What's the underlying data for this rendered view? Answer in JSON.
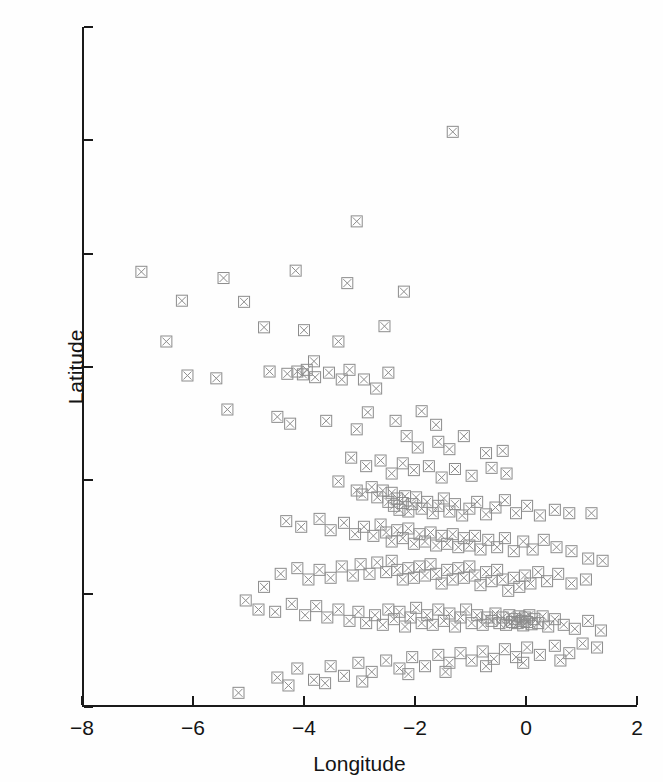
{
  "chart_data": {
    "type": "scatter",
    "title": "",
    "xlabel": "Longitude",
    "ylabel": "Latitude",
    "xlim": [
      -8,
      2
    ],
    "ylim": [
      50,
      62
    ],
    "xticks": [
      -8,
      -6,
      -4,
      -2,
      0,
      2
    ],
    "yticks": [
      50,
      52,
      54,
      56,
      58,
      60,
      62
    ],
    "xtick_labels": [
      "−8",
      "−6",
      "−4",
      "−2",
      "0",
      "2"
    ],
    "ytick_labels": [
      "50",
      "52",
      "54",
      "56",
      "58",
      "60",
      "62"
    ],
    "grid": false,
    "legend": null,
    "marker": {
      "shape": "boxed-x",
      "size": 11,
      "color": "#8c8c8c",
      "fill": "none",
      "line_width": 1
    },
    "series": [
      {
        "name": "stations",
        "points": [
          [
            -1.32,
            60.15
          ],
          [
            -3.05,
            58.57
          ],
          [
            -6.93,
            57.68
          ],
          [
            -5.45,
            57.57
          ],
          [
            -4.15,
            57.7
          ],
          [
            -3.22,
            57.48
          ],
          [
            -6.2,
            57.17
          ],
          [
            -5.08,
            57.15
          ],
          [
            -2.2,
            57.33
          ],
          [
            -6.48,
            56.45
          ],
          [
            -4.72,
            56.7
          ],
          [
            -4.0,
            56.65
          ],
          [
            -3.38,
            56.45
          ],
          [
            -2.55,
            56.72
          ],
          [
            -3.82,
            56.1
          ],
          [
            -6.1,
            55.85
          ],
          [
            -5.38,
            55.25
          ],
          [
            -5.58,
            55.8
          ],
          [
            -4.62,
            55.92
          ],
          [
            -4.3,
            55.88
          ],
          [
            -4.12,
            55.92
          ],
          [
            -4.02,
            55.87
          ],
          [
            -3.95,
            55.95
          ],
          [
            -3.8,
            55.82
          ],
          [
            -3.55,
            55.9
          ],
          [
            -3.32,
            55.78
          ],
          [
            -3.18,
            55.95
          ],
          [
            -2.92,
            55.78
          ],
          [
            -2.7,
            55.62
          ],
          [
            -2.48,
            55.9
          ],
          [
            -4.48,
            55.12
          ],
          [
            -4.25,
            55.0
          ],
          [
            -3.6,
            55.05
          ],
          [
            -3.05,
            54.9
          ],
          [
            -2.85,
            55.2
          ],
          [
            -2.35,
            55.05
          ],
          [
            -1.88,
            55.22
          ],
          [
            -1.62,
            54.98
          ],
          [
            -2.15,
            54.78
          ],
          [
            -1.95,
            54.58
          ],
          [
            -1.58,
            54.68
          ],
          [
            -1.38,
            54.55
          ],
          [
            -1.12,
            54.78
          ],
          [
            -0.72,
            54.48
          ],
          [
            -0.42,
            54.52
          ],
          [
            -3.15,
            54.4
          ],
          [
            -2.88,
            54.25
          ],
          [
            -2.62,
            54.35
          ],
          [
            -2.42,
            54.12
          ],
          [
            -2.22,
            54.3
          ],
          [
            -2.02,
            54.18
          ],
          [
            -1.75,
            54.25
          ],
          [
            -1.52,
            54.05
          ],
          [
            -1.28,
            54.2
          ],
          [
            -0.98,
            54.08
          ],
          [
            -0.62,
            54.22
          ],
          [
            -0.35,
            54.12
          ],
          [
            -3.38,
            53.98
          ],
          [
            -3.05,
            53.82
          ],
          [
            -2.95,
            53.75
          ],
          [
            -2.78,
            53.88
          ],
          [
            -2.68,
            53.7
          ],
          [
            -2.58,
            53.82
          ],
          [
            -2.48,
            53.62
          ],
          [
            -2.42,
            53.78
          ],
          [
            -2.38,
            53.55
          ],
          [
            -2.32,
            53.68
          ],
          [
            -2.28,
            53.48
          ],
          [
            -2.22,
            53.6
          ],
          [
            -2.18,
            53.72
          ],
          [
            -2.12,
            53.45
          ],
          [
            -2.05,
            53.58
          ],
          [
            -1.98,
            53.7
          ],
          [
            -1.88,
            53.5
          ],
          [
            -1.78,
            53.62
          ],
          [
            -1.68,
            53.42
          ],
          [
            -1.58,
            53.55
          ],
          [
            -1.48,
            53.68
          ],
          [
            -1.38,
            53.45
          ],
          [
            -1.28,
            53.58
          ],
          [
            -1.15,
            53.38
          ],
          [
            -1.02,
            53.5
          ],
          [
            -0.88,
            53.62
          ],
          [
            -0.72,
            53.4
          ],
          [
            -0.55,
            53.52
          ],
          [
            -0.38,
            53.65
          ],
          [
            -0.18,
            53.42
          ],
          [
            0.02,
            53.55
          ],
          [
            0.25,
            53.38
          ],
          [
            0.52,
            53.48
          ],
          [
            0.78,
            53.42
          ],
          [
            1.18,
            53.42
          ],
          [
            -4.32,
            53.28
          ],
          [
            -4.05,
            53.18
          ],
          [
            -3.72,
            53.32
          ],
          [
            -3.52,
            53.12
          ],
          [
            -3.28,
            53.25
          ],
          [
            -3.08,
            53.05
          ],
          [
            -2.92,
            53.18
          ],
          [
            -2.75,
            53.02
          ],
          [
            -2.62,
            53.22
          ],
          [
            -2.52,
            53.08
          ],
          [
            -2.42,
            52.92
          ],
          [
            -2.32,
            53.12
          ],
          [
            -2.22,
            52.98
          ],
          [
            -2.12,
            53.15
          ],
          [
            -2.02,
            52.88
          ],
          [
            -1.92,
            53.05
          ],
          [
            -1.82,
            52.92
          ],
          [
            -1.72,
            53.08
          ],
          [
            -1.62,
            52.85
          ],
          [
            -1.52,
            53.02
          ],
          [
            -1.42,
            52.88
          ],
          [
            -1.32,
            53.05
          ],
          [
            -1.22,
            52.82
          ],
          [
            -1.12,
            52.98
          ],
          [
            -1.02,
            52.85
          ],
          [
            -0.92,
            53.02
          ],
          [
            -0.82,
            52.78
          ],
          [
            -0.68,
            52.95
          ],
          [
            -0.52,
            52.82
          ],
          [
            -0.38,
            52.98
          ],
          [
            -0.22,
            52.75
          ],
          [
            -0.05,
            52.92
          ],
          [
            0.12,
            52.78
          ],
          [
            0.32,
            52.95
          ],
          [
            0.55,
            52.82
          ],
          [
            0.82,
            52.75
          ],
          [
            1.12,
            52.62
          ],
          [
            1.38,
            52.58
          ],
          [
            -5.05,
            51.88
          ],
          [
            -4.72,
            52.12
          ],
          [
            -4.42,
            52.35
          ],
          [
            -4.12,
            52.45
          ],
          [
            -3.92,
            52.25
          ],
          [
            -3.72,
            52.42
          ],
          [
            -3.52,
            52.28
          ],
          [
            -3.32,
            52.48
          ],
          [
            -3.12,
            52.32
          ],
          [
            -2.98,
            52.52
          ],
          [
            -2.82,
            52.35
          ],
          [
            -2.68,
            52.55
          ],
          [
            -2.52,
            52.38
          ],
          [
            -2.42,
            52.58
          ],
          [
            -2.32,
            52.42
          ],
          [
            -2.22,
            52.25
          ],
          [
            -2.12,
            52.45
          ],
          [
            -2.02,
            52.28
          ],
          [
            -1.92,
            52.48
          ],
          [
            -1.82,
            52.32
          ],
          [
            -1.72,
            52.52
          ],
          [
            -1.62,
            52.35
          ],
          [
            -1.52,
            52.18
          ],
          [
            -1.42,
            52.42
          ],
          [
            -1.32,
            52.25
          ],
          [
            -1.22,
            52.45
          ],
          [
            -1.12,
            52.28
          ],
          [
            -1.02,
            52.48
          ],
          [
            -0.92,
            52.32
          ],
          [
            -0.82,
            52.15
          ],
          [
            -0.72,
            52.38
          ],
          [
            -0.62,
            52.22
          ],
          [
            -0.52,
            52.42
          ],
          [
            -0.42,
            52.25
          ],
          [
            -0.32,
            52.05
          ],
          [
            -0.22,
            52.28
          ],
          [
            -0.12,
            52.12
          ],
          [
            -0.02,
            52.32
          ],
          [
            0.08,
            52.18
          ],
          [
            0.22,
            52.38
          ],
          [
            0.38,
            52.22
          ],
          [
            0.58,
            52.35
          ],
          [
            0.82,
            52.18
          ],
          [
            1.08,
            52.25
          ],
          [
            -4.82,
            51.72
          ],
          [
            -4.52,
            51.68
          ],
          [
            -4.22,
            51.82
          ],
          [
            -3.98,
            51.62
          ],
          [
            -3.78,
            51.78
          ],
          [
            -3.58,
            51.58
          ],
          [
            -3.38,
            51.72
          ],
          [
            -3.18,
            51.52
          ],
          [
            -3.02,
            51.68
          ],
          [
            -2.88,
            51.48
          ],
          [
            -2.72,
            51.62
          ],
          [
            -2.58,
            51.45
          ],
          [
            -2.48,
            51.72
          ],
          [
            -2.38,
            51.55
          ],
          [
            -2.28,
            51.68
          ],
          [
            -2.18,
            51.42
          ],
          [
            -2.08,
            51.58
          ],
          [
            -1.98,
            51.75
          ],
          [
            -1.88,
            51.48
          ],
          [
            -1.78,
            51.62
          ],
          [
            -1.68,
            51.45
          ],
          [
            -1.58,
            51.72
          ],
          [
            -1.48,
            51.52
          ],
          [
            -1.38,
            51.65
          ],
          [
            -1.28,
            51.42
          ],
          [
            -1.18,
            51.58
          ],
          [
            -1.08,
            51.72
          ],
          [
            -0.98,
            51.48
          ],
          [
            -0.88,
            51.62
          ],
          [
            -0.78,
            51.45
          ],
          [
            -0.7,
            51.58
          ],
          [
            -0.62,
            51.52
          ],
          [
            -0.55,
            51.65
          ],
          [
            -0.48,
            51.48
          ],
          [
            -0.42,
            51.58
          ],
          [
            -0.36,
            51.45
          ],
          [
            -0.3,
            51.62
          ],
          [
            -0.25,
            51.5
          ],
          [
            -0.2,
            51.55
          ],
          [
            -0.15,
            51.48
          ],
          [
            -0.12,
            51.6
          ],
          [
            -0.08,
            51.52
          ],
          [
            -0.05,
            51.44
          ],
          [
            -0.02,
            51.58
          ],
          [
            0.02,
            51.5
          ],
          [
            0.06,
            51.62
          ],
          [
            0.1,
            51.46
          ],
          [
            0.15,
            51.55
          ],
          [
            0.22,
            51.48
          ],
          [
            0.3,
            51.6
          ],
          [
            0.4,
            51.42
          ],
          [
            0.52,
            51.55
          ],
          [
            0.68,
            51.45
          ],
          [
            0.88,
            51.38
          ],
          [
            1.12,
            51.52
          ],
          [
            1.35,
            51.35
          ],
          [
            -5.18,
            50.25
          ],
          [
            -4.48,
            50.52
          ],
          [
            -4.12,
            50.68
          ],
          [
            -3.82,
            50.48
          ],
          [
            -3.52,
            50.72
          ],
          [
            -3.28,
            50.55
          ],
          [
            -3.02,
            50.78
          ],
          [
            -2.78,
            50.62
          ],
          [
            -2.52,
            50.82
          ],
          [
            -2.28,
            50.68
          ],
          [
            -2.05,
            50.88
          ],
          [
            -1.82,
            50.72
          ],
          [
            -1.58,
            50.92
          ],
          [
            -1.38,
            50.78
          ],
          [
            -1.18,
            50.95
          ],
          [
            -0.98,
            50.82
          ],
          [
            -0.78,
            50.98
          ],
          [
            -0.58,
            50.85
          ],
          [
            -0.38,
            51.02
          ],
          [
            -0.18,
            50.88
          ],
          [
            0.02,
            51.05
          ],
          [
            0.25,
            50.92
          ],
          [
            0.52,
            51.08
          ],
          [
            0.78,
            50.95
          ],
          [
            1.02,
            51.12
          ],
          [
            1.28,
            51.05
          ],
          [
            -4.28,
            50.38
          ],
          [
            -3.62,
            50.42
          ],
          [
            -2.95,
            50.45
          ],
          [
            -2.12,
            50.58
          ],
          [
            -1.45,
            50.62
          ],
          [
            -0.72,
            50.72
          ],
          [
            -0.05,
            50.78
          ],
          [
            0.62,
            50.82
          ]
        ]
      }
    ]
  }
}
